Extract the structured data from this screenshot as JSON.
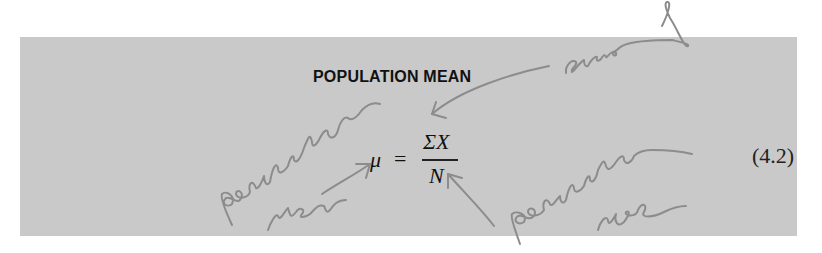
{
  "box": {
    "title": "POPULATION MEAN",
    "background": "#c9c9c9"
  },
  "formula": {
    "lhs": "μ",
    "equals": "=",
    "numerator": "ΣX",
    "denominator": "N",
    "equation_number": "(4.2)"
  },
  "annotations": {
    "sum_of": "sum of",
    "population_mean": "population mean",
    "population_size": "population size",
    "ink_color": "#8c8c8c"
  }
}
